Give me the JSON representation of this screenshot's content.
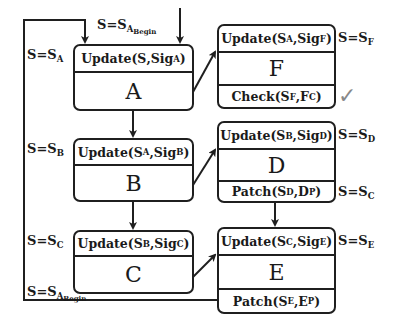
{
  "diagram": {
    "boxes": {
      "A": {
        "name": "A",
        "update": {
          "fn": "Update(",
          "arg1": "S",
          "arg1_sub": "",
          "sep": ",Sig",
          "sig_sub": "A",
          "close": ")"
        }
      },
      "B": {
        "name": "B",
        "update": {
          "fn": "Update(",
          "arg1": "S",
          "arg1_sub": "A",
          "sep": ",Sig",
          "sig_sub": "B",
          "close": ")"
        }
      },
      "C": {
        "name": "C",
        "update": {
          "fn": "Update(",
          "arg1": "S",
          "arg1_sub": "B",
          "sep": ",Sig",
          "sig_sub": "C",
          "close": ")"
        }
      },
      "F": {
        "name": "F",
        "update": {
          "fn": "Update(",
          "arg1": "S",
          "arg1_sub": "A",
          "sep": ",Sig",
          "sig_sub": "F",
          "close": ")"
        },
        "footer": {
          "fn": "Check(",
          "a": "S",
          "a_sub": "F",
          "b": ",F",
          "b_sub": "C",
          "close": ")"
        }
      },
      "D": {
        "name": "D",
        "update": {
          "fn": "Update(",
          "arg1": "S",
          "arg1_sub": "B",
          "sep": ",Sig",
          "sig_sub": "D",
          "close": ")"
        },
        "footer": {
          "fn": "Patch(",
          "a": "S",
          "a_sub": "D",
          "b": ",D",
          "b_sub": "P",
          "close": ")"
        }
      },
      "E": {
        "name": "E",
        "update": {
          "fn": "Update(",
          "arg1": "S",
          "arg1_sub": "C",
          "sep": ",Sig",
          "sig_sub": "E",
          "close": ")"
        },
        "footer": {
          "fn": "Patch(",
          "a": "S",
          "a_sub": "E",
          "b": ",E",
          "b_sub": "P",
          "close": ")"
        }
      }
    },
    "labels": {
      "begin_top": {
        "text": "S=S",
        "sub": "A",
        "subsub": "Begin"
      },
      "sa": {
        "text": "S=S",
        "sub": "A"
      },
      "sb": {
        "text": "S=S",
        "sub": "B"
      },
      "sc_left": {
        "text": "S=S",
        "sub": "C"
      },
      "begin_bottom": {
        "text": "S=S",
        "sub": "A",
        "subsub": "Begin"
      },
      "sf": {
        "text": "S=S",
        "sub": "F"
      },
      "sd": {
        "text": "S=S",
        "sub": "D"
      },
      "sc_right": {
        "text": "S=S",
        "sub": "C"
      },
      "se": {
        "text": "S=S",
        "sub": "E"
      }
    },
    "check_mark": "✓"
  }
}
